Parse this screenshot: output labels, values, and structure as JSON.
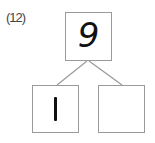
{
  "problem": {
    "label": "(12)",
    "top_box": {
      "value": "9"
    },
    "bottom_left_box": {
      "value": "1"
    },
    "bottom_right_box": {
      "value": ""
    }
  }
}
